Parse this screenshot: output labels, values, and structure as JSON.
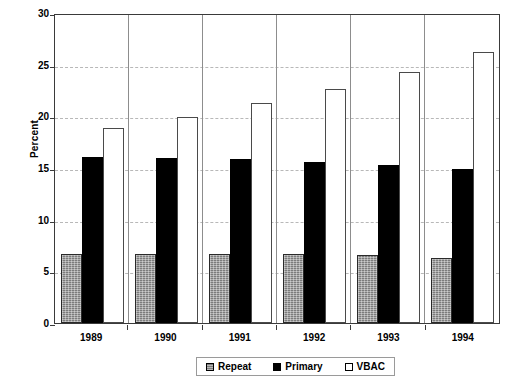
{
  "chart_data": {
    "type": "bar",
    "title": "",
    "xlabel": "",
    "ylabel": "Percent",
    "categories": [
      "1989",
      "1990",
      "1991",
      "1992",
      "1993",
      "1994"
    ],
    "series": [
      {
        "name": "Repeat",
        "values": [
          6.7,
          6.7,
          6.7,
          6.7,
          6.6,
          6.3
        ]
      },
      {
        "name": "Primary",
        "values": [
          16.1,
          16.0,
          15.9,
          15.6,
          15.3,
          14.9
        ]
      },
      {
        "name": "VBAC",
        "values": [
          18.9,
          19.9,
          21.3,
          22.6,
          24.3,
          26.2
        ]
      }
    ],
    "ylim": [
      0,
      30
    ],
    "ytick_values": [
      0,
      5,
      10,
      15,
      20,
      25,
      30
    ],
    "ytick_labels": [
      "0",
      "5",
      "10",
      "15",
      "20",
      "25",
      "30"
    ],
    "grid": true,
    "grid_axis": "y",
    "legend_position": "bottom-center",
    "colors": {
      "repeat": "#7c7c7c",
      "primary": "#000000",
      "vbac": "#ffffff",
      "grid": "#b8b8b8",
      "frame": "#3a3a3a"
    }
  },
  "legend": {
    "items": [
      {
        "label": "Repeat"
      },
      {
        "label": "Primary"
      },
      {
        "label": "VBAC"
      }
    ]
  }
}
